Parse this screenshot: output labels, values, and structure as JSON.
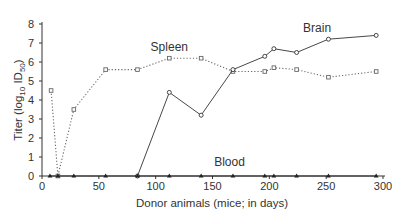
{
  "chart_data": {
    "type": "line",
    "title": "",
    "xlabel": "Donor animals (mice; in days)",
    "ylabel": "Titer (log10 ID50)",
    "ylabel_parts": {
      "main": "Titer (log",
      "sub1": "10",
      "mid": " ID",
      "sub2": "50",
      "end": ")"
    },
    "xlim": [
      0,
      300
    ],
    "ylim": [
      0,
      8
    ],
    "xticks": [
      0,
      50,
      100,
      150,
      200,
      250,
      300
    ],
    "yticks": [
      0,
      1,
      2,
      3,
      4,
      5,
      6,
      7,
      8
    ],
    "grid": false,
    "legend": "inline labels",
    "series": [
      {
        "name": "Spleen",
        "style": "dotted",
        "marker": "open-square",
        "color": "#666666",
        "label_pos": {
          "x": 112,
          "y": 6.6
        },
        "points": [
          [
            8,
            4.5
          ],
          [
            14,
            0
          ],
          [
            28,
            3.5
          ],
          [
            56,
            5.6
          ],
          [
            84,
            5.6
          ],
          [
            112,
            6.2
          ],
          [
            140,
            6.2
          ],
          [
            168,
            5.5
          ],
          [
            196,
            5.5
          ],
          [
            204,
            5.7
          ],
          [
            224,
            5.6
          ],
          [
            252,
            5.2
          ],
          [
            294,
            5.5
          ]
        ]
      },
      {
        "name": "Brain",
        "style": "solid",
        "marker": "open-circle",
        "color": "#333333",
        "label_pos": {
          "x": 242,
          "y": 7.6
        },
        "points": [
          [
            84,
            0
          ],
          [
            112,
            4.4
          ],
          [
            140,
            3.2
          ],
          [
            168,
            5.6
          ],
          [
            196,
            6.3
          ],
          [
            204,
            6.7
          ],
          [
            224,
            6.5
          ],
          [
            252,
            7.2
          ],
          [
            294,
            7.4
          ]
        ]
      },
      {
        "name": "Blood",
        "style": "solid",
        "marker": "filled-triangle",
        "color": "#222222",
        "label_pos": {
          "x": 165,
          "y": 0.55
        },
        "points": [
          [
            7,
            0
          ],
          [
            14,
            0
          ],
          [
            28,
            0
          ],
          [
            56,
            0
          ],
          [
            84,
            0
          ],
          [
            112,
            0
          ],
          [
            140,
            0
          ],
          [
            168,
            0
          ],
          [
            196,
            0
          ],
          [
            204,
            0
          ],
          [
            224,
            0
          ],
          [
            252,
            0
          ],
          [
            294,
            0
          ]
        ]
      }
    ]
  }
}
